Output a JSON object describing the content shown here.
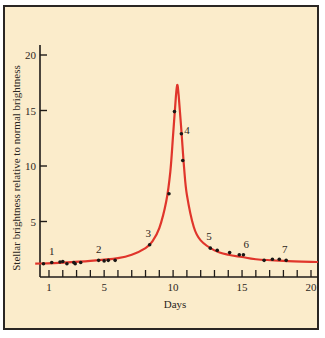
{
  "chart_data": {
    "type": "line",
    "title": "",
    "xlabel": "Days",
    "ylabel": "Stellar brightness relative to normal brightness",
    "xlim": [
      0,
      20.5
    ],
    "ylim": [
      0,
      21
    ],
    "xticks": [
      1,
      5,
      10,
      15,
      20
    ],
    "xtick_minor": [
      1,
      2,
      3,
      4,
      5,
      6,
      7,
      8,
      9,
      10,
      11,
      12,
      13,
      14,
      15,
      16,
      17,
      18,
      19,
      20
    ],
    "yticks": [
      5,
      10,
      15,
      20
    ],
    "grid": false,
    "legend": null,
    "colors": {
      "curve": "#e0352b",
      "points": "#1a1715",
      "background": "#fbeccb",
      "axis": "#1f1b18"
    },
    "series": [
      {
        "name": "observed",
        "kind": "scatter",
        "x": [
          0.6,
          1.2,
          1.8,
          2.0,
          2.3,
          2.8,
          2.9,
          3.3,
          4.6,
          5.0,
          5.3,
          5.8,
          8.3,
          9.7,
          10.1,
          10.6,
          10.7,
          12.7,
          13.2,
          14.1,
          14.8,
          15.1,
          16.6,
          17.2,
          17.7,
          18.2
        ],
        "y": [
          1.2,
          1.3,
          1.35,
          1.4,
          1.2,
          1.3,
          1.2,
          1.3,
          1.5,
          1.45,
          1.5,
          1.5,
          2.9,
          7.5,
          14.9,
          12.9,
          10.5,
          2.6,
          2.4,
          2.2,
          2.0,
          2.0,
          1.5,
          1.6,
          1.6,
          1.5
        ]
      },
      {
        "name": "fitted light curve",
        "kind": "line",
        "x": [
          0,
          2,
          4,
          6,
          7,
          8,
          8.5,
          9,
          9.5,
          9.8,
          10.0,
          10.2,
          10.3,
          10.4,
          10.6,
          10.8,
          11.0,
          11.5,
          12,
          13,
          14,
          15,
          16,
          18,
          20.5
        ],
        "y": [
          1.2,
          1.3,
          1.45,
          1.7,
          2.0,
          2.6,
          3.2,
          4.4,
          6.8,
          9.5,
          12.8,
          16.2,
          17.3,
          16.4,
          13.2,
          9.8,
          7.4,
          4.5,
          3.3,
          2.4,
          2.0,
          1.8,
          1.6,
          1.45,
          1.35
        ]
      }
    ],
    "annotations": [
      {
        "text": "1",
        "x": 1.2,
        "y": 2.0
      },
      {
        "text": "2",
        "x": 4.6,
        "y": 2.2
      },
      {
        "text": "3",
        "x": 8.2,
        "y": 3.6
      },
      {
        "text": "4",
        "x": 11.0,
        "y": 12.9
      },
      {
        "text": "5",
        "x": 12.6,
        "y": 3.3
      },
      {
        "text": "6",
        "x": 15.3,
        "y": 2.6
      },
      {
        "text": "7",
        "x": 18.1,
        "y": 2.2
      }
    ]
  }
}
